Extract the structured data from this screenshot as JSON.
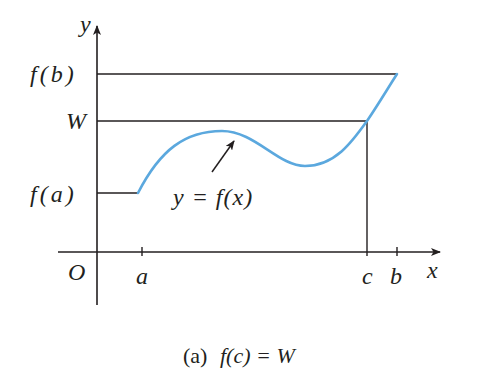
{
  "diagram": {
    "axes": {
      "x_label": "x",
      "y_label": "y",
      "origin_label": "O"
    },
    "y_ticks": {
      "fb": "f(b)",
      "W": "W",
      "fa": "f(a)"
    },
    "x_ticks": {
      "a": "a",
      "c": "c",
      "b": "b"
    },
    "curve_label": "y = f(x)",
    "caption_prefix": "(a)",
    "caption_math": "f(c) = W",
    "colors": {
      "curve": "#5ba8de",
      "lines": "#231f20",
      "background": "#ffffff"
    }
  }
}
